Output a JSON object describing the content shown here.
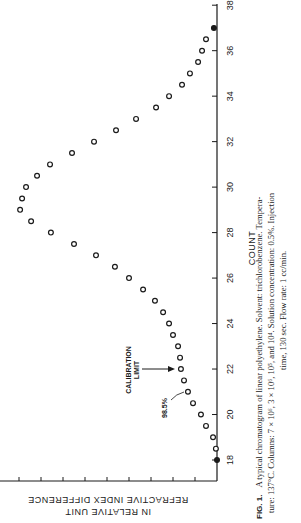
{
  "chart_data": {
    "type": "scatter",
    "orientation": "rotated 90° counter-clockwise (x-axis COUNT runs vertically on the right, increasing upward)",
    "title": "",
    "xlabel": "COUNT",
    "ylabel": "REFRACTIVE INDEX DIFFERENCE IN RELATIVE UNIT",
    "xlim": [
      17,
      38
    ],
    "ylim": [
      0,
      10
    ],
    "x_ticks": [
      18,
      20,
      22,
      24,
      26,
      28,
      30,
      32,
      34,
      36,
      38
    ],
    "y_ticks_count": 10,
    "y_tick_labels_shown": false,
    "grid": false,
    "legend": null,
    "series": [
      {
        "name": "chromatogram",
        "marker": "open-circle",
        "x": [
          18.0,
          18.5,
          19.0,
          19.5,
          20.0,
          20.5,
          21.0,
          21.5,
          22.0,
          22.5,
          23.0,
          23.5,
          24.0,
          24.5,
          25.0,
          25.5,
          26.0,
          26.5,
          27.0,
          27.5,
          28.0,
          28.5,
          29.0,
          29.5,
          30.0,
          30.5,
          31.0,
          31.5,
          32.0,
          32.5,
          33.0,
          33.5,
          34.0,
          34.5,
          35.0,
          35.5,
          36.0,
          36.5,
          37.0
        ],
        "values": [
          0.0,
          0.05,
          0.18,
          0.5,
          0.73,
          1.09,
          1.32,
          1.5,
          1.64,
          1.68,
          1.77,
          2.0,
          2.18,
          2.45,
          2.82,
          3.36,
          4.0,
          4.64,
          5.5,
          6.5,
          7.55,
          8.45,
          8.95,
          8.86,
          8.68,
          8.18,
          7.59,
          6.59,
          5.59,
          4.59,
          3.68,
          2.77,
          2.18,
          1.59,
          1.23,
          0.86,
          0.68,
          0.5,
          0.14
        ],
        "filled_points_at_x": [
          18.0,
          37.0
        ]
      }
    ],
    "annotations": [
      {
        "text": "CALIBRATION LIMIT",
        "points_to_count": 22.0,
        "type": "arrow"
      },
      {
        "text": "98.5%",
        "points_to_count": 21.0,
        "type": "leader-line"
      }
    ]
  },
  "axis": {
    "x_title": "COUNT",
    "x_ticks": [
      "18",
      "20",
      "22",
      "24",
      "26",
      "28",
      "30",
      "32",
      "34",
      "36",
      "38"
    ],
    "y_title_line1": "REFRACTIVE INDEX DIFFERENCE",
    "y_title_line2": "IN RELATIVE UNIT"
  },
  "annotations": {
    "calibration_line1": "CALIBRATION",
    "calibration_line2": "LIMIT",
    "percent": "98.5%"
  },
  "caption": {
    "label": "FIG. 1.",
    "line1": "A typical chromatogram of linear polyethylene.  Solvent:  trichlorobenzene.  Tempera-",
    "line2": "ture: 137°C. Columns: 7 × 10⁶, 3 × 10⁶, 10⁵, and 10⁴. Solution concentration: 0.5%. Injection",
    "line3": "time, 130 sec. Flow rate: 1 cc/min."
  }
}
